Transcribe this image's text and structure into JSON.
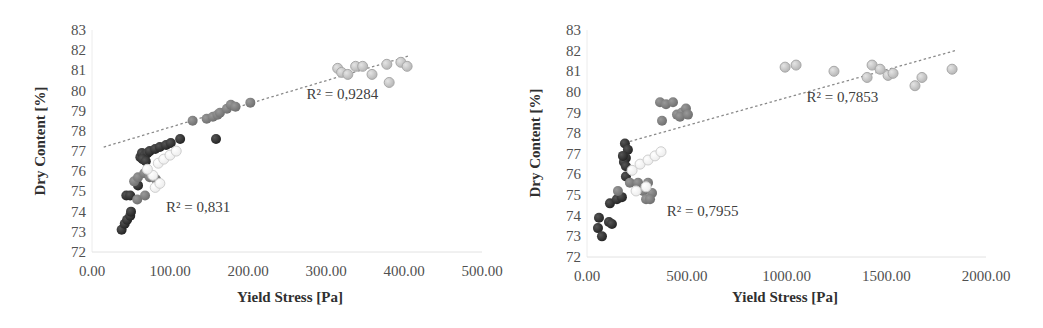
{
  "chart_data": [
    {
      "type": "scatter",
      "title": "",
      "xlabel": "Yield Stress [Pa]",
      "ylabel": "Dry Content [%]",
      "xlim": [
        0,
        500
      ],
      "ylim": [
        72,
        83
      ],
      "xticks": [
        "0.00",
        "100.00",
        "200.00",
        "300.00",
        "400.00",
        "500.00"
      ],
      "yticks": [
        "72",
        "73",
        "74",
        "75",
        "76",
        "77",
        "78",
        "79",
        "80",
        "81",
        "82",
        "83"
      ],
      "grid": false,
      "legend": null,
      "annotations": [
        {
          "text": "R² = 0,831",
          "x": 95,
          "y": 74.0
        },
        {
          "text": "R² = 0,9284",
          "x": 275,
          "y": 79.6
        }
      ],
      "trendlines": [
        {
          "style": "dotted",
          "from": [
            15,
            77.2
          ],
          "to": [
            405,
            81.7
          ],
          "r2": "0,9284"
        }
      ],
      "series": [
        {
          "name": "dark",
          "color": "#2e2e2e",
          "points": [
            [
              38,
              73.1
            ],
            [
              42,
              73.4
            ],
            [
              45,
              73.6
            ],
            [
              49,
              73.8
            ],
            [
              50,
              74.0
            ],
            [
              44,
              74.8
            ],
            [
              49,
              74.8
            ],
            [
              59,
              75.3
            ],
            [
              62,
              76.7
            ],
            [
              64,
              76.9
            ],
            [
              68,
              76.8
            ],
            [
              71,
              76.9
            ],
            [
              74,
              77.0
            ],
            [
              81,
              77.1
            ],
            [
              87,
              77.2
            ],
            [
              95,
              77.3
            ],
            [
              101,
              77.4
            ],
            [
              113,
              77.6
            ],
            [
              159,
              77.6
            ],
            [
              65,
              76.6
            ],
            [
              69,
              76.5
            ]
          ]
        },
        {
          "name": "medium",
          "color": "#7c7c7c",
          "points": [
            [
              54,
              75.5
            ],
            [
              59,
              75.7
            ],
            [
              67,
              75.9
            ],
            [
              74,
              75.7
            ],
            [
              82,
              75.6
            ],
            [
              58,
              74.6
            ],
            [
              68,
              74.8
            ],
            [
              129,
              78.5
            ],
            [
              147,
              78.6
            ],
            [
              155,
              78.7
            ],
            [
              161,
              78.8
            ],
            [
              164,
              78.9
            ],
            [
              173,
              79.1
            ],
            [
              178,
              79.3
            ],
            [
              184,
              79.2
            ],
            [
              203,
              79.4
            ]
          ]
        },
        {
          "name": "light-outline",
          "color": "#e6e6e6",
          "points": [
            [
              85,
              76.4
            ],
            [
              92,
              76.6
            ],
            [
              100,
              76.8
            ],
            [
              108,
              77.0
            ],
            [
              81,
              75.2
            ],
            [
              87,
              75.4
            ],
            [
              78,
              75.8
            ],
            [
              71,
              76.1
            ]
          ]
        },
        {
          "name": "light-gray",
          "color": "#c4c4c4",
          "points": [
            [
              315,
              81.1
            ],
            [
              320,
              80.9
            ],
            [
              328,
              80.8
            ],
            [
              338,
              81.2
            ],
            [
              347,
              81.2
            ],
            [
              359,
              80.8
            ],
            [
              378,
              81.3
            ],
            [
              381,
              80.4
            ],
            [
              396,
              81.4
            ],
            [
              404,
              81.2
            ]
          ]
        }
      ]
    },
    {
      "type": "scatter",
      "title": "",
      "xlabel": "Yield Stress [Pa]",
      "ylabel": "Dry Content [%]",
      "xlim": [
        0,
        2000
      ],
      "ylim": [
        72,
        83
      ],
      "xticks": [
        "0.00",
        "500.00",
        "1000.00",
        "1500.00",
        "2000.00"
      ],
      "yticks": [
        "72",
        "73",
        "74",
        "75",
        "76",
        "77",
        "78",
        "79",
        "80",
        "81",
        "82",
        "83"
      ],
      "grid": false,
      "legend": null,
      "annotations": [
        {
          "text": "R² = 0,7955",
          "x": 400,
          "y": 74.0
        },
        {
          "text": "R² = 0,7853",
          "x": 1100,
          "y": 79.5
        }
      ],
      "trendlines": [
        {
          "style": "dotted",
          "from": [
            215,
            77.6
          ],
          "to": [
            1845,
            82.0
          ],
          "r2": "0,7853"
        }
      ],
      "series": [
        {
          "name": "dark",
          "color": "#2e2e2e",
          "points": [
            [
              60,
              73.9
            ],
            [
              55,
              73.4
            ],
            [
              75,
              73.0
            ],
            [
              110,
              73.7
            ],
            [
              125,
              73.6
            ],
            [
              115,
              74.6
            ],
            [
              150,
              74.8
            ],
            [
              195,
              75.9
            ],
            [
              190,
              77.5
            ],
            [
              205,
              77.2
            ],
            [
              195,
              76.8
            ],
            [
              185,
              76.6
            ],
            [
              195,
              76.4
            ],
            [
              180,
              76.9
            ],
            [
              175,
              74.9
            ]
          ]
        },
        {
          "name": "medium",
          "color": "#7c7c7c",
          "points": [
            [
              366,
              79.5
            ],
            [
              396,
              79.4
            ],
            [
              431,
              79.5
            ],
            [
              376,
              78.6
            ],
            [
              451,
              78.9
            ],
            [
              476,
              79.0
            ],
            [
              496,
              79.2
            ],
            [
              466,
              78.8
            ],
            [
              506,
              78.9
            ],
            [
              155,
              75.2
            ],
            [
              215,
              75.6
            ],
            [
              256,
              75.6
            ],
            [
              281,
              75.2
            ],
            [
              296,
              74.8
            ],
            [
              326,
              75.1
            ],
            [
              316,
              74.8
            ],
            [
              306,
              75.6
            ]
          ]
        },
        {
          "name": "light-outline",
          "color": "#e6e6e6",
          "points": [
            [
              226,
              76.2
            ],
            [
              266,
              76.5
            ],
            [
              306,
              76.7
            ],
            [
              341,
              76.9
            ],
            [
              371,
              77.1
            ],
            [
              246,
              75.2
            ],
            [
              296,
              75.4
            ]
          ]
        },
        {
          "name": "light-gray",
          "color": "#c4c4c4",
          "points": [
            [
              993,
              81.2
            ],
            [
              1048,
              81.3
            ],
            [
              1238,
              81.0
            ],
            [
              1404,
              80.7
            ],
            [
              1429,
              81.3
            ],
            [
              1469,
              81.1
            ],
            [
              1509,
              80.8
            ],
            [
              1534,
              80.9
            ],
            [
              1644,
              80.3
            ],
            [
              1679,
              80.7
            ],
            [
              1830,
              81.1
            ]
          ]
        }
      ]
    }
  ]
}
